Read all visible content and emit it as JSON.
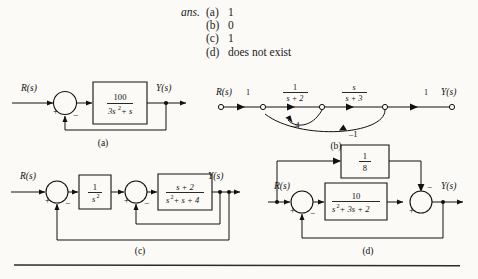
{
  "answers": {
    "label": "ans.",
    "items": [
      {
        "key": "(a)",
        "value": "1"
      },
      {
        "key": "(b)",
        "value": "0"
      },
      {
        "key": "(c)",
        "value": "1"
      },
      {
        "key": "(d)",
        "value": "does not exist"
      }
    ]
  },
  "figures": {
    "a": {
      "caption": "(a)",
      "input_label": "R(s)",
      "output_label": "Y(s)",
      "summer": {
        "sign_left": "+",
        "sign_feedback": "−"
      },
      "block": {
        "numerator": "100",
        "denominator": "3s",
        "denominator_exp": "2",
        "denominator_tail": "+ s"
      }
    },
    "b": {
      "caption": "(b)",
      "input_label": "R(s)",
      "output_label": "Y(s)",
      "gain_in": "1",
      "gain_out": "1",
      "branch1": {
        "numerator": "1",
        "denominator": "s + 2"
      },
      "branch2": {
        "numerator": "s",
        "denominator": "s + 3"
      },
      "feedback_inner": "–4",
      "feedback_outer": "–1"
    },
    "c": {
      "caption": "(c)",
      "input_label": "R(s)",
      "output_label": "Y(s)",
      "summer1": {
        "sign_left": "+",
        "sign_feedback": "−"
      },
      "summer2": {
        "sign_left": "+",
        "sign_feedback": "−"
      },
      "block1": {
        "numerator": "1",
        "denominator": "s",
        "denominator_exp": "2"
      },
      "block2": {
        "numerator": "s + 2",
        "denominator": "s",
        "denominator_exp": "2",
        "denominator_tail": "+ s + 4"
      }
    },
    "d": {
      "caption": "(d)",
      "input_label": "R(s)",
      "output_label": "Y(s)",
      "summer1": {
        "sign_left": "+",
        "sign_feedback": "−"
      },
      "summer2": {
        "sign_left": "+",
        "sign_top": "−"
      },
      "block_top": {
        "numerator": "1",
        "denominator": "8"
      },
      "block_main": {
        "numerator": "10",
        "denominator": "s",
        "denominator_exp": "2",
        "denominator_tail": "+ 3s + 2"
      }
    }
  },
  "colors": {
    "page_background": "#fbfaf7",
    "ink": "#111111",
    "rule": "#2b2b2b"
  }
}
